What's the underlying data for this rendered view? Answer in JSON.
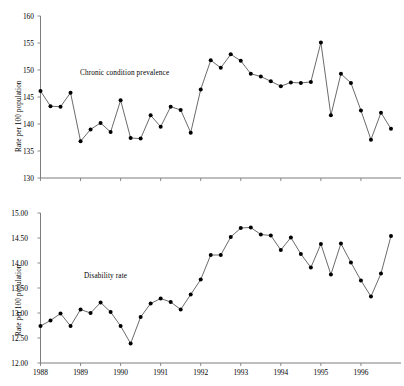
{
  "figure": {
    "background": "#ffffff",
    "axis_color": "#7d7d7d",
    "line_color": "#3a3a3a",
    "marker_color": "#000000"
  },
  "chart_data": [
    {
      "id": "chronic-condition-prevalence",
      "type": "line",
      "title": "",
      "series_label": "Chronic condition prevalence",
      "xlabel": "",
      "ylabel": "Rate per 100 population",
      "ylim": [
        130,
        160
      ],
      "yticks": [
        130,
        135,
        140,
        145,
        150,
        155,
        160
      ],
      "ytick_labels": [
        "130",
        "135",
        "140",
        "145",
        "150",
        "155",
        "160"
      ],
      "xlim": [
        1988.0,
        1997.0
      ],
      "xticks": [
        1988,
        1989,
        1990,
        1991,
        1992,
        1993,
        1994,
        1995,
        1996
      ],
      "xtick_labels": [
        "1988",
        "1989",
        "1990",
        "1991",
        "1992",
        "1993",
        "1994",
        "1995",
        "1996"
      ],
      "grid": false,
      "legend": "none",
      "x": [
        1988.0,
        1988.25,
        1988.5,
        1988.75,
        1989.0,
        1989.25,
        1989.5,
        1989.75,
        1990.0,
        1990.25,
        1990.5,
        1990.75,
        1991.0,
        1991.25,
        1991.5,
        1991.75,
        1992.0,
        1992.25,
        1992.5,
        1992.75,
        1993.0,
        1993.25,
        1993.5,
        1993.75,
        1994.0,
        1994.25,
        1994.5,
        1994.75,
        1995.0,
        1995.25,
        1995.5,
        1995.75,
        1996.0,
        1996.25,
        1996.5,
        1996.75
      ],
      "values": [
        146.1,
        143.3,
        143.2,
        145.8,
        136.8,
        139.0,
        140.2,
        138.5,
        144.4,
        137.4,
        137.3,
        141.6,
        139.5,
        143.2,
        142.6,
        138.4,
        146.4,
        151.8,
        150.4,
        152.9,
        151.7,
        149.3,
        148.8,
        147.9,
        147.0,
        147.7,
        147.6,
        147.8,
        155.1,
        141.6,
        149.3,
        147.6,
        142.5,
        137.1,
        142.1,
        139.1
      ]
    },
    {
      "id": "disability-rate",
      "type": "line",
      "title": "",
      "series_label": "Disability rate",
      "xlabel": "",
      "ylabel": "Rate per 100 population",
      "ylim": [
        12.0,
        15.0
      ],
      "yticks": [
        12.0,
        12.5,
        13.0,
        13.5,
        14.0,
        14.5,
        15.0
      ],
      "ytick_labels": [
        "12.00",
        "12.50",
        "13.00",
        "13.50",
        "14.00",
        "14.50",
        "15.00"
      ],
      "xlim": [
        1988.0,
        1997.0
      ],
      "xticks": [
        1988,
        1989,
        1990,
        1991,
        1992,
        1993,
        1994,
        1995,
        1996
      ],
      "xtick_labels": [
        "1988",
        "1989",
        "1990",
        "1991",
        "1992",
        "1993",
        "1994",
        "1995",
        "1996"
      ],
      "grid": false,
      "legend": "none",
      "x": [
        1988.0,
        1988.25,
        1988.5,
        1988.75,
        1989.0,
        1989.25,
        1989.5,
        1989.75,
        1990.0,
        1990.25,
        1990.5,
        1990.75,
        1991.0,
        1991.25,
        1991.5,
        1991.75,
        1992.0,
        1992.25,
        1992.5,
        1992.75,
        1993.0,
        1993.25,
        1993.5,
        1993.75,
        1994.0,
        1994.25,
        1994.5,
        1994.75,
        1995.0,
        1995.25,
        1995.5,
        1995.75,
        1996.0,
        1996.25,
        1996.5,
        1996.75
      ],
      "values": [
        12.74,
        12.85,
        12.99,
        12.74,
        13.07,
        13.0,
        13.21,
        13.02,
        12.74,
        12.39,
        12.92,
        13.19,
        13.29,
        13.22,
        13.07,
        13.37,
        13.67,
        14.16,
        14.16,
        14.52,
        14.7,
        14.71,
        14.57,
        14.55,
        14.26,
        14.51,
        14.18,
        13.91,
        14.38,
        13.77,
        14.39,
        14.01,
        13.65,
        13.33,
        13.79,
        14.54
      ]
    }
  ]
}
